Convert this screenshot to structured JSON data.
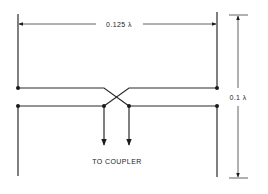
{
  "diagram": {
    "type": "antenna-feed-schematic",
    "labels": {
      "width_dimension": "0.125 λ",
      "height_dimension": "0.1 λ",
      "feed": "TO COUPLER"
    },
    "colors": {
      "line": "#2a2a2a",
      "background": "#ffffff"
    }
  }
}
